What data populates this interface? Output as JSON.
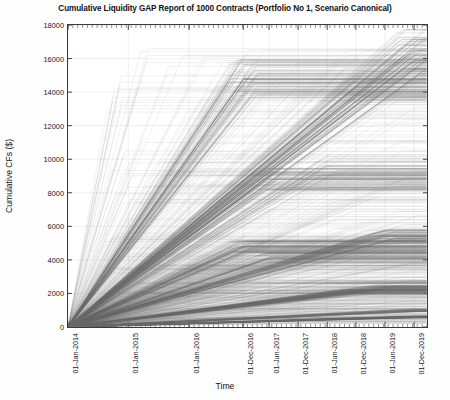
{
  "chart_data": {
    "type": "line",
    "title": "Cumulative Liquidity GAP Report of 1000 Contracts (Portfolio No 1, Scenario Canonical)",
    "xlabel": "Time",
    "ylabel": "Cumulative CFs ($)",
    "grid": true,
    "legend": "none",
    "line_color": "#6e6e6e",
    "n_series": 1000,
    "ylim": [
      0,
      18000
    ],
    "ytick_labels": [
      "0",
      "2000",
      "4000",
      "6000",
      "8000",
      "10000",
      "12000",
      "14000",
      "16000",
      "18000"
    ],
    "ytick_values": [
      0,
      2000,
      4000,
      6000,
      8000,
      10000,
      12000,
      14000,
      16000,
      18000
    ],
    "xtick_labels": [
      "01-Jan-2014",
      "01-Jan-2015",
      "01-Jan-2016",
      "01-Dec-2016",
      "01-Jun-2017",
      "01-Dec-2017",
      "01-Jun-2018",
      "01-Dec-2018",
      "01-Jun-2019",
      "01-Dec-2019"
    ],
    "xtick_positions": [
      0,
      0.168,
      0.337,
      0.488,
      0.56,
      0.641,
      0.722,
      0.802,
      0.883,
      0.964
    ],
    "xlim_labels": [
      "01-Jan-2014",
      "01-Dec-2019"
    ],
    "series": [
      {
        "name": "bundle-top-plateau",
        "plateau_value": 14800,
        "plateau_x": 0.49,
        "end_value": 14800,
        "count": 60
      },
      {
        "name": "bundle-top-rising",
        "plateau_value": 16500,
        "plateau_x": 0.96,
        "end_value": 16500,
        "count": 40
      },
      {
        "name": "bundle-16000",
        "plateau_value": 16000,
        "plateau_x": 0.96,
        "end_value": 16000,
        "count": 30
      },
      {
        "name": "bundle-14300",
        "plateau_value": 14300,
        "plateau_x": 0.8,
        "end_value": 14300,
        "count": 25
      },
      {
        "name": "bundle-9600",
        "plateau_value": 9600,
        "plateau_x": 0.72,
        "end_value": 9600,
        "count": 12
      },
      {
        "name": "bundle-8800",
        "plateau_value": 8800,
        "plateau_x": 0.56,
        "end_value": 8800,
        "count": 40
      },
      {
        "name": "bundle-5400",
        "plateau_value": 5400,
        "plateau_x": 0.88,
        "end_value": 5400,
        "count": 45
      },
      {
        "name": "bundle-4800",
        "plateau_value": 4800,
        "plateau_x": 0.49,
        "end_value": 4800,
        "count": 55
      },
      {
        "name": "bundle-4100",
        "plateau_value": 4100,
        "plateau_x": 0.56,
        "end_value": 4100,
        "count": 35
      },
      {
        "name": "bundle-2300",
        "plateau_value": 2300,
        "plateau_x": 0.88,
        "end_value": 2300,
        "count": 40
      },
      {
        "name": "bundle-2100",
        "plateau_value": 2100,
        "plateau_x": 0.8,
        "end_value": 2100,
        "count": 35
      },
      {
        "name": "bundle-1000",
        "plateau_value": 1000,
        "plateau_x": 0.96,
        "end_value": 1000,
        "count": 30
      },
      {
        "name": "bundle-low-spread",
        "plateau_value": 600,
        "plateau_x": 0.96,
        "end_value": 600,
        "count": 60
      }
    ]
  }
}
